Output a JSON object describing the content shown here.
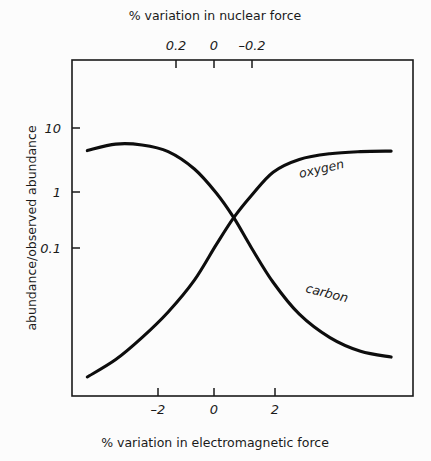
{
  "chart_data": {
    "type": "line",
    "title": "",
    "xlabel": "% variation in electromagnetic force",
    "xlabel_top": "% variation in nuclear force",
    "ylabel": "abundance/observed abundance",
    "yscale": "log",
    "grid": false,
    "legend_position": "inline-on-curve",
    "xlim": [
      -3.6,
      4.2
    ],
    "ylim_log": [
      -1.85,
      1.55
    ],
    "x_ticks": [
      {
        "value": -2,
        "label": "–2"
      },
      {
        "value": 0,
        "label": "0"
      },
      {
        "value": 2,
        "label": "2"
      }
    ],
    "x_ticks_top": [
      {
        "value": 0.2,
        "label": "0.2"
      },
      {
        "value": 0,
        "label": "0"
      },
      {
        "value": -0.2,
        "label": "–0.2"
      }
    ],
    "y_ticks": [
      {
        "value": 10,
        "label": "10"
      },
      {
        "value": 1,
        "label": "1"
      },
      {
        "value": 0.1,
        "label": "0.1"
      }
    ],
    "series": [
      {
        "name": "carbon",
        "label": "carbon",
        "description": "sigmoid decreasing left-to-right",
        "x": [
          -3.25,
          -2.6,
          -2.0,
          -1.4,
          -0.8,
          -0.3,
          0.1,
          0.5,
          1.0,
          1.6,
          2.3,
          3.0,
          3.7
        ],
        "y": [
          4.3,
          5.0,
          4.9,
          4.2,
          2.8,
          1.6,
          0.9,
          0.45,
          0.2,
          0.095,
          0.055,
          0.04,
          0.035
        ]
      },
      {
        "name": "oxygen",
        "label": "oxygen",
        "description": "sigmoid increasing left-to-right",
        "x": [
          -3.25,
          -2.6,
          -2.0,
          -1.4,
          -0.8,
          -0.3,
          0.1,
          0.5,
          1.0,
          1.6,
          2.3,
          3.0,
          3.7
        ],
        "y": [
          0.022,
          0.033,
          0.055,
          0.1,
          0.21,
          0.48,
          0.9,
          1.5,
          2.6,
          3.5,
          4.0,
          4.2,
          4.25
        ]
      }
    ]
  },
  "colors": {
    "ink": "#1a1a1a",
    "curve": "#0d0d0d",
    "background": "#fcfcfc"
  }
}
